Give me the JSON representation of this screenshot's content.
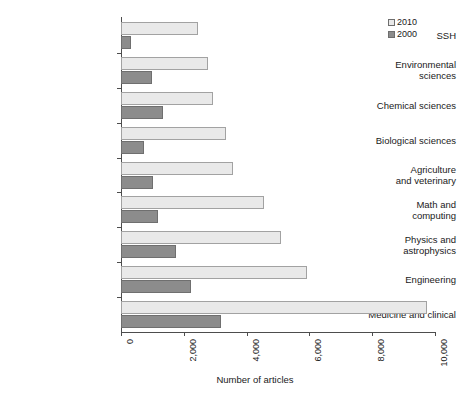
{
  "chart_data": {
    "type": "bar",
    "orientation": "horizontal",
    "title": "",
    "xlabel": "Number of articles",
    "ylabel": "",
    "xlim": [
      0,
      10000
    ],
    "xticks": [
      "0",
      "2,000",
      "4,000",
      "6,000",
      "8,000",
      "10,000"
    ],
    "xtick_values": [
      0,
      2000,
      4000,
      6000,
      8000,
      10000
    ],
    "grid": false,
    "legend_position": "top-right",
    "categories": [
      "SSH",
      "Environmental\nsciences",
      "Chemical sciences",
      "Biological sciences",
      "Agriculture\nand veterinary",
      "Math and\ncomputing",
      "Physics and\nastrophysics",
      "Engineering",
      "Medicine and clinical"
    ],
    "series": [
      {
        "name": "2010",
        "color": "#e9e9e9",
        "values": [
          2440,
          2780,
          2920,
          3330,
          3580,
          4570,
          5090,
          5930,
          9740
        ]
      },
      {
        "name": "2000",
        "color": "#8c8c8c",
        "values": [
          320,
          980,
          1330,
          740,
          1020,
          1180,
          1750,
          2230,
          3170
        ]
      }
    ]
  },
  "legend": {
    "items": [
      {
        "label": "2010",
        "swatch": "light-gray-square"
      },
      {
        "label": "2000",
        "swatch": "dark-gray-square"
      }
    ]
  }
}
